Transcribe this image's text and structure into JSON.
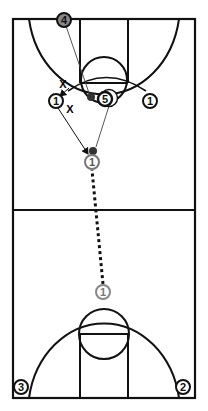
{
  "diagram": {
    "type": "basketball-play-diagram",
    "court": {
      "orientation": "vertical-full-court",
      "line_color": "#111111",
      "background": "#ffffff"
    },
    "players": [
      {
        "id": "p4",
        "label": "4",
        "style": "filled-gray",
        "x": 64,
        "y": 20
      },
      {
        "id": "p1-left",
        "label": "1",
        "style": "outline",
        "x": 56,
        "y": 101
      },
      {
        "id": "p5",
        "label": "5",
        "style": "outline-bold",
        "x": 105,
        "y": 99
      },
      {
        "id": "p1-right",
        "label": "1",
        "style": "outline",
        "x": 150,
        "y": 101
      },
      {
        "id": "p1-top",
        "label": "1",
        "style": "outline-gray",
        "x": 92,
        "y": 162
      },
      {
        "id": "p1-bottom",
        "label": "1",
        "style": "outline-gray",
        "x": 103,
        "y": 292
      },
      {
        "id": "p3",
        "label": "3",
        "style": "outline",
        "x": 21,
        "y": 387
      },
      {
        "id": "p2",
        "label": "2",
        "style": "outline",
        "x": 183,
        "y": 387
      }
    ],
    "defenders": [
      {
        "id": "x1",
        "label": "X",
        "x": 63,
        "y": 84
      },
      {
        "id": "x2",
        "label": "X",
        "x": 70,
        "y": 109
      }
    ],
    "balls": [
      {
        "id": "ball-low-post",
        "x": 91,
        "y": 97
      },
      {
        "id": "ball-wing",
        "x": 93,
        "y": 151
      }
    ],
    "actions": [
      {
        "type": "pass-line",
        "from": "p4",
        "to": "ball-low-post"
      },
      {
        "type": "cut-arrow",
        "from": "x1",
        "to": "p1-left"
      },
      {
        "type": "cut-arrow",
        "from": "p1-left",
        "to": "p1-top"
      },
      {
        "type": "pass-line",
        "from": "p5",
        "to": "ball-wing"
      },
      {
        "type": "dribble-dotted",
        "from": "p1-bottom",
        "to": "p1-top"
      }
    ]
  }
}
